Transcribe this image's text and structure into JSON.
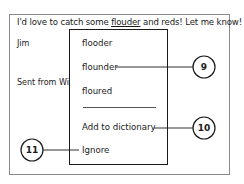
{
  "message": {
    "text_before": "I'd love to catch some ",
    "misspelled_word": "flouder",
    "text_after": " and reds! Let me know!",
    "signature_name": "Jim",
    "sent_from": "Sent from Wi"
  },
  "context_menu": {
    "suggestions": [
      "flooder",
      "flounder",
      "floured"
    ],
    "add_to_dictionary": "Add to dictionary",
    "ignore": "Ignore"
  },
  "callouts": {
    "flounder": "9",
    "add_to_dictionary": "10",
    "ignore": "11"
  }
}
